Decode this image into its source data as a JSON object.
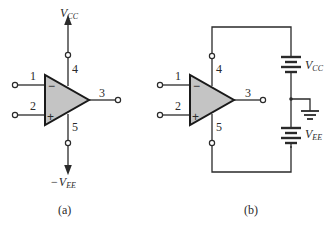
{
  "diagram": {
    "type": "op-amp symbol and power supply connection",
    "panel_a": {
      "caption": "(a)",
      "pins": {
        "inverting": "1",
        "noninverting": "2",
        "output": "3",
        "pos_supply": "4",
        "neg_supply": "5"
      },
      "signs": {
        "inverting": "−",
        "noninverting": "+"
      },
      "supply_top": {
        "prefix": "",
        "symbol": "V",
        "subscript": "CC"
      },
      "supply_bottom": {
        "prefix": "−",
        "symbol": "V",
        "subscript": "EE"
      }
    },
    "panel_b": {
      "caption": "(b)",
      "pins": {
        "inverting": "1",
        "noninverting": "2",
        "output": "3",
        "pos_supply": "4",
        "neg_supply": "5"
      },
      "signs": {
        "inverting": "−",
        "noninverting": "+"
      },
      "battery_top": {
        "symbol": "V",
        "subscript": "CC"
      },
      "battery_bottom": {
        "symbol": "V",
        "subscript": "EE"
      },
      "ground": "ground-symbol"
    },
    "colors": {
      "triangle_fill": "#c4c4c4",
      "stroke": "#2a2a2a",
      "background": "#ffffff"
    }
  }
}
